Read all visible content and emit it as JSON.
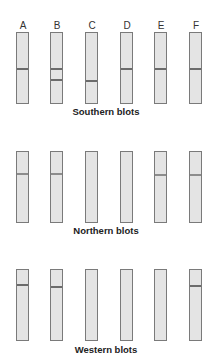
{
  "lanes": [
    "A",
    "B",
    "C",
    "D",
    "E",
    "F"
  ],
  "panels": [
    {
      "title": "Southern blots",
      "bands": {
        "A": [
          68
        ],
        "B": [
          68,
          79
        ],
        "C": [
          80
        ],
        "D": [
          68
        ],
        "E": [
          68
        ],
        "F": [
          68
        ]
      }
    },
    {
      "title": "Northern blots",
      "bands": {
        "A": [
          173
        ],
        "B": [
          173
        ],
        "C": [],
        "D": [],
        "E": [
          174
        ],
        "F": [
          174
        ]
      }
    },
    {
      "title": "Western blots",
      "bands": {
        "A": [
          284
        ],
        "B": [
          286
        ],
        "C": [],
        "D": [],
        "E": [],
        "F": [
          286
        ]
      }
    }
  ],
  "colors": {
    "lane_fill": "#e4e4e4",
    "lane_border": "#7a7a7a",
    "band": "#6b6b6b"
  }
}
